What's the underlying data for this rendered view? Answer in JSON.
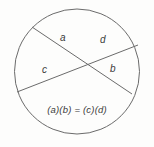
{
  "diagram": {
    "shape": "circle",
    "stroke_color": "#6b6b6b",
    "text_color": "#3b3b3b",
    "background_color": "#fdfdfc",
    "circle": {
      "cx": 77,
      "cy": 71.5,
      "r": 62.5
    },
    "chords": [
      {
        "name": "chord-a-b",
        "x1": 32,
        "y1": 27,
        "x2": 132,
        "y2": 94,
        "segments": [
          "a",
          "b"
        ]
      },
      {
        "name": "chord-c-d",
        "x1": 17,
        "y1": 92,
        "x2": 138,
        "y2": 45,
        "segments": [
          "c",
          "d"
        ]
      }
    ],
    "labels": {
      "a": "a",
      "b": "b",
      "c": "c",
      "d": "d"
    },
    "equation": "(a)(b) = (c)(d)"
  }
}
